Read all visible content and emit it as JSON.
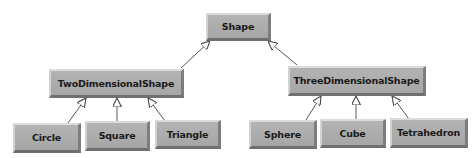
{
  "diagram": {
    "type": "UML class hierarchy (inheritance)",
    "colors": {
      "node_fill": "#acacac",
      "node_text": "#1a1a1a",
      "edge": "#444444",
      "background": "#ffffff"
    },
    "nodes": {
      "shape": {
        "label": "Shape"
      },
      "two_d": {
        "label": "TwoDimensionalShape"
      },
      "three_d": {
        "label": "ThreeDimensionalShape"
      },
      "circle": {
        "label": "Circle"
      },
      "square": {
        "label": "Square"
      },
      "triangle": {
        "label": "Triangle"
      },
      "sphere": {
        "label": "Sphere"
      },
      "cube": {
        "label": "Cube"
      },
      "tetrahedron": {
        "label": "Tetrahedron"
      }
    },
    "edges": [
      {
        "from": "TwoDimensionalShape",
        "to": "Shape",
        "kind": "generalization"
      },
      {
        "from": "ThreeDimensionalShape",
        "to": "Shape",
        "kind": "generalization"
      },
      {
        "from": "Circle",
        "to": "TwoDimensionalShape",
        "kind": "generalization"
      },
      {
        "from": "Square",
        "to": "TwoDimensionalShape",
        "kind": "generalization"
      },
      {
        "from": "Triangle",
        "to": "TwoDimensionalShape",
        "kind": "generalization"
      },
      {
        "from": "Sphere",
        "to": "ThreeDimensionalShape",
        "kind": "generalization"
      },
      {
        "from": "Cube",
        "to": "ThreeDimensionalShape",
        "kind": "generalization"
      },
      {
        "from": "Tetrahedron",
        "to": "ThreeDimensionalShape",
        "kind": "generalization"
      }
    ]
  }
}
